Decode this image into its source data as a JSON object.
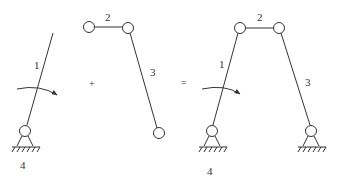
{
  "diagram": {
    "operators": {
      "plus": "+",
      "equals": "="
    },
    "left_part": {
      "link1_label": "1",
      "ground_label": "4"
    },
    "middle_part": {
      "link2_label": "2",
      "link3_label": "3"
    },
    "result": {
      "link1_label": "1",
      "link2_label": "2",
      "link3_label": "3",
      "ground_label": "4"
    },
    "colors": {
      "stroke": "#333333",
      "background": "#ffffff"
    }
  }
}
